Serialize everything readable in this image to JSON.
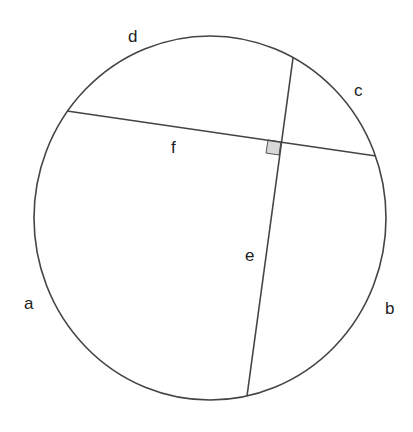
{
  "diagram": {
    "type": "circle-with-perpendicular-chords",
    "colors": {
      "stroke": "#444444",
      "right_angle_fill": "#d8d8d8",
      "background": "#ffffff"
    },
    "labels": {
      "a": "a",
      "b": "b",
      "c": "c",
      "d": "d",
      "e": "e",
      "f": "f"
    },
    "chords": [
      {
        "name": "e",
        "from": [
          293,
          58
        ],
        "to": [
          247,
          396
        ]
      },
      {
        "name": "f",
        "from": [
          67,
          111
        ],
        "to": [
          376,
          156
        ]
      }
    ],
    "right_angle_marker": true
  }
}
